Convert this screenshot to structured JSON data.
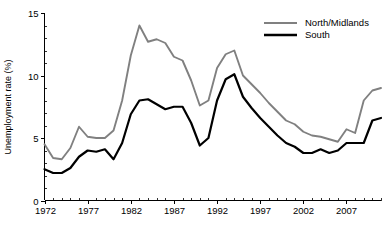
{
  "chart_data": {
    "type": "line",
    "title": "",
    "xlabel": "",
    "ylabel": "Unemployment rate (%)",
    "xlim": [
      1972,
      2011
    ],
    "ylim": [
      0,
      15
    ],
    "yticks": [
      0,
      5,
      10,
      15
    ],
    "ytick_labels": [
      "0",
      "5",
      "10",
      "15"
    ],
    "yticks_minor_step": 1,
    "xticks": [
      1972,
      1977,
      1982,
      1987,
      1992,
      1997,
      2002,
      2007
    ],
    "xtick_labels": [
      "1972",
      "1977",
      "1982",
      "1987",
      "1992",
      "1997",
      "2002",
      "2007"
    ],
    "xticks_minor_step": 1,
    "grid": false,
    "legend_position": "top-right",
    "colors": {
      "north_midlands": "#808080",
      "south": "#000000",
      "axis": "#000000",
      "background": "#ffffff"
    },
    "x": [
      1972,
      1973,
      1974,
      1975,
      1976,
      1977,
      1978,
      1979,
      1980,
      1981,
      1982,
      1983,
      1984,
      1985,
      1986,
      1987,
      1988,
      1989,
      1990,
      1991,
      1992,
      1993,
      1994,
      1995,
      1996,
      1997,
      1998,
      1999,
      2000,
      2001,
      2002,
      2003,
      2004,
      2005,
      2006,
      2007,
      2008,
      2009,
      2010,
      2011
    ],
    "series": [
      {
        "name": "North/Midlands",
        "color": "#808080",
        "values": [
          4.5,
          3.4,
          3.3,
          4.2,
          5.9,
          5.1,
          5.0,
          5.0,
          5.6,
          8.0,
          11.6,
          14.0,
          12.7,
          12.9,
          12.6,
          11.5,
          11.2,
          9.6,
          7.6,
          8.0,
          10.6,
          11.7,
          12.0,
          10.0,
          9.3,
          8.6,
          7.8,
          7.1,
          6.4,
          6.1,
          5.5,
          5.2,
          5.1,
          4.9,
          4.7,
          5.7,
          5.4,
          8.0,
          8.8,
          9.0
        ]
      },
      {
        "name": "South",
        "color": "#000000",
        "values": [
          2.5,
          2.2,
          2.2,
          2.6,
          3.5,
          4.0,
          3.9,
          4.1,
          3.3,
          4.6,
          6.9,
          8.0,
          8.1,
          7.7,
          7.3,
          7.5,
          7.5,
          6.2,
          4.4,
          5.0,
          8.0,
          9.7,
          10.1,
          8.3,
          7.4,
          6.6,
          5.9,
          5.2,
          4.6,
          4.3,
          3.8,
          3.8,
          4.1,
          3.8,
          4.0,
          4.6,
          4.6,
          4.6,
          6.4,
          6.6
        ]
      }
    ],
    "legend": [
      {
        "label": "North/Midlands",
        "color": "#808080",
        "line_width": 2.0
      },
      {
        "label": "South",
        "color": "#000000",
        "line_width": 2.4
      }
    ]
  }
}
